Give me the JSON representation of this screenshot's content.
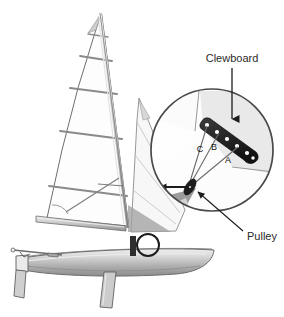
{
  "figure": {
    "width": 284,
    "height": 317,
    "background_color": "#ffffff"
  },
  "callouts": {
    "clewboard": {
      "label": "Clewboard",
      "x": 232,
      "y": 62,
      "leader_from": [
        232,
        68
      ],
      "leader_to": [
        232,
        121
      ]
    },
    "pulley": {
      "label": "Pulley",
      "x": 247,
      "y": 238,
      "leader_from": [
        244,
        232
      ],
      "leader_to": [
        196,
        191
      ]
    }
  },
  "line_labels": [
    {
      "label": "C",
      "x": 200,
      "y": 152
    },
    {
      "label": "B",
      "x": 214,
      "y": 150
    },
    {
      "label": "A",
      "x": 228,
      "y": 163
    }
  ],
  "magnifier": {
    "name": "magnified-inset-circle",
    "center": [
      212,
      150
    ],
    "radius": 61,
    "stroke_color": "#4a4a4a",
    "fill_color": "#ffffff"
  },
  "detail_marker": {
    "name": "detail-origin-circle",
    "center": [
      148,
      245
    ],
    "radius": 11,
    "stroke_color": "#1c1c1c"
  },
  "clewboard_plate": {
    "name": "clewboard-plate",
    "fill_color": "#2e2e2e",
    "hole_color": "#ffffff",
    "hole_count": 6
  },
  "pulley_block": {
    "name": "pulley-block",
    "center": [
      190,
      187
    ],
    "fill_color": "#222222"
  },
  "colors": {
    "sail_outline": "#6e6e6e",
    "sail_fill": "#fdfdfd",
    "sail_shadow": "#d9d9d9",
    "hull_light": "#d7d7d7",
    "hull_mid": "#b4b4b4",
    "hull_dark": "#8f8f8f",
    "spar": "#c8c8c8",
    "ink": "#2b2b2b"
  },
  "parts": [
    {
      "name": "mainsail",
      "label": "Mainsail"
    },
    {
      "name": "jib",
      "label": "Jib"
    },
    {
      "name": "mast",
      "label": "Mast"
    },
    {
      "name": "boom",
      "label": "Boom"
    },
    {
      "name": "hull",
      "label": "Hull"
    },
    {
      "name": "centreboard",
      "label": "Centreboard"
    },
    {
      "name": "rudder",
      "label": "Rudder"
    },
    {
      "name": "bowsprit",
      "label": "Bowsprit"
    }
  ]
}
